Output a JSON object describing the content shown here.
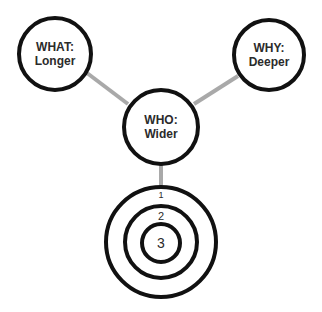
{
  "diagram": {
    "colors": {
      "stroke": "#111111",
      "connector": "#a9a9a9",
      "text": "#2b2b2b",
      "background": "#ffffff"
    },
    "nodes": [
      {
        "id": "what",
        "line1": "WHAT:",
        "line2": "Longer"
      },
      {
        "id": "why",
        "line1": "WHY:",
        "line2": "Deeper"
      },
      {
        "id": "who",
        "line1": "WHO:",
        "line2": "Wider"
      }
    ],
    "target": {
      "rings": [
        {
          "label": "1"
        },
        {
          "label": "2"
        },
        {
          "label": "3"
        }
      ]
    },
    "connectors": [
      {
        "from": "what",
        "to": "who"
      },
      {
        "from": "why",
        "to": "who"
      },
      {
        "from": "who",
        "to": "target"
      }
    ]
  }
}
